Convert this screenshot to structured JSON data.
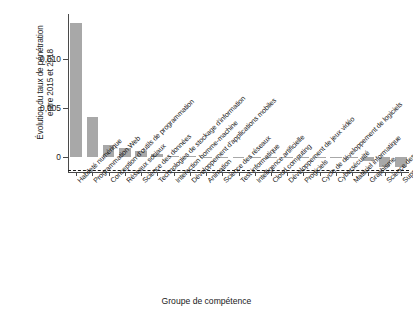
{
  "chart_data": {
    "type": "bar",
    "title": "",
    "xlabel": "Groupe de compétence",
    "ylabel_line1": "Évolution du taux de pénétration",
    "ylabel_line2": "entre 2015 et 2018",
    "categories": [
      "Habileté numérique",
      "Programmation Web",
      "Conception d'outils de programmation",
      "Réseaux sociaux",
      "Science des données",
      "Technologies de stockage d'information",
      "Interaction homme-machine",
      "Développement d'applications mobiles",
      "Animation",
      "Science des réseaux",
      "Test informatique",
      "Intelligence artificielle",
      "Cloud computing",
      "Développement de jeux vidéo",
      "Progiciels",
      "Cycle de développement de logiciels",
      "Cybersécurité",
      "Matériel informatique",
      "Graphisme",
      "Science des réseaux",
      "Support technique"
    ],
    "values": [
      0.01375,
      0.0041,
      0.00122,
      0.001,
      0.00062,
      0.0003,
      0.00015,
      0.0001,
      8e-05,
      6e-05,
      5e-05,
      4e-05,
      3e-05,
      2e-05,
      1e-05,
      0.0,
      -2e-05,
      -5e-05,
      -0.00033,
      -0.00098,
      -0.001
    ],
    "ytick_labels": [
      "0",
      "0,005",
      "0,010"
    ],
    "ytick_values": [
      0,
      0.005,
      0.01
    ],
    "ylim": [
      -0.0015,
      0.01465
    ],
    "bar_color": "#a8a8a8",
    "axis_color": "#4a4a4a",
    "zero_line": "dashed",
    "grid": false,
    "legend": "none"
  }
}
